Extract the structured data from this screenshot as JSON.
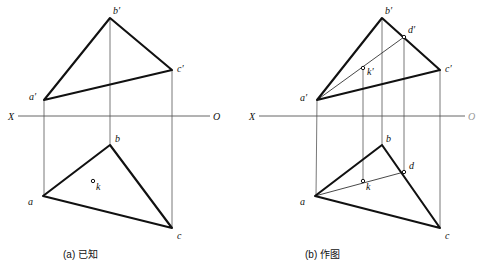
{
  "figure": {
    "title_type": "descriptive-geometry-orthographic-projection",
    "axis_label_left": "X",
    "axis_label_right_a": "O",
    "axis_label_right_b": "O"
  },
  "captions": {
    "a": "(a) 已知",
    "b": "(b) 作图"
  },
  "colors": {
    "outline": "#111111",
    "thin": "#555555",
    "axis": "#555555",
    "background": "#ffffff"
  },
  "panel_a": {
    "name": "given",
    "caption": "(a) 已知",
    "axis": {
      "y": 116,
      "x1": 18,
      "x2": 210,
      "label_left": "X",
      "label_right": "O"
    },
    "points": {
      "a_prime": {
        "label": "a′",
        "x": 44,
        "y": 100,
        "lx": 29,
        "ly": 96
      },
      "b_prime": {
        "label": "b′",
        "x": 110,
        "y": 18,
        "lx": 112,
        "ly": 12
      },
      "c_prime": {
        "label": "c′",
        "x": 172,
        "y": 70,
        "lx": 176,
        "ly": 68
      },
      "a": {
        "label": "a",
        "x": 43,
        "y": 196,
        "lx": 28,
        "ly": 202
      },
      "b": {
        "label": "b",
        "x": 110,
        "y": 145,
        "lx": 114,
        "ly": 139
      },
      "c": {
        "label": "c",
        "x": 172,
        "y": 228,
        "lx": 176,
        "ly": 236
      },
      "k": {
        "label": "k",
        "x": 93,
        "y": 181,
        "lx": 96,
        "ly": 190
      }
    },
    "triangle_upper": "a′b′c′",
    "triangle_lower": "abc",
    "projection_lines": [
      "a′-a",
      "b′-b",
      "c′-c"
    ]
  },
  "panel_b": {
    "name": "construction",
    "caption": "(b) 作图",
    "axis": {
      "y": 116,
      "x1": 259,
      "x2": 465,
      "label_left": "X",
      "label_right": "O"
    },
    "points": {
      "a_prime": {
        "label": "a′",
        "x": 317,
        "y": 100,
        "lx": 300,
        "ly": 97
      },
      "b_prime": {
        "label": "b′",
        "x": 382,
        "y": 18,
        "lx": 384,
        "ly": 12
      },
      "c_prime": {
        "label": "c′",
        "x": 440,
        "y": 70,
        "lx": 444,
        "ly": 67
      },
      "d_prime": {
        "label": "d′",
        "x": 404,
        "y": 37,
        "lx": 408,
        "ly": 32
      },
      "k_prime": {
        "label": "k′",
        "x": 363,
        "y": 68,
        "lx": 366,
        "ly": 76
      },
      "a": {
        "label": "a",
        "x": 315,
        "y": 196,
        "lx": 300,
        "ly": 202
      },
      "b": {
        "label": "b",
        "x": 382,
        "y": 145,
        "lx": 386,
        "ly": 139
      },
      "c": {
        "label": "c",
        "x": 440,
        "y": 228,
        "lx": 444,
        "ly": 236
      },
      "d": {
        "label": "d",
        "x": 404,
        "y": 172,
        "lx": 408,
        "ly": 167
      },
      "k": {
        "label": "k",
        "x": 363,
        "y": 181,
        "lx": 366,
        "ly": 190
      }
    },
    "triangle_upper": "a′b′c′",
    "triangle_lower": "abc",
    "construction_lines": [
      "a′-d′ through k′",
      "a-d through k"
    ],
    "projection_lines": [
      "a′-a",
      "b′-b",
      "c′-c",
      "d′-d",
      "k′-k"
    ]
  }
}
